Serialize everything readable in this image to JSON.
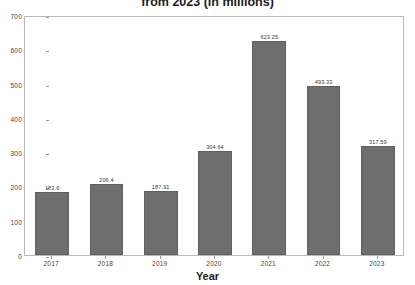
{
  "chart_data": {
    "type": "bar",
    "title": "from 2023 (in millions)",
    "xlabel": "Year",
    "ylabel": "",
    "categories": [
      "2017",
      "2018",
      "2019",
      "2020",
      "2021",
      "2022",
      "2023"
    ],
    "values": [
      183.6,
      206.4,
      187.91,
      304.64,
      623.25,
      493.33,
      317.59
    ],
    "value_labels": [
      "183.6",
      "206.4",
      "187.91",
      "304.64",
      "623.25",
      "493.33",
      "317.59"
    ],
    "ylim": [
      0,
      700
    ],
    "yticks": [
      0,
      100,
      200,
      300,
      400,
      500,
      600,
      700
    ],
    "ytick_labels": [
      "0",
      "100",
      "200",
      "300",
      "400",
      "500",
      "600",
      "700"
    ],
    "grid": false,
    "legend": null,
    "bar_color": "#6e6e6e",
    "bar_edge_color": "#5f5f5f",
    "background_color": "#ffffff",
    "axis_color": "#b9b9b9",
    "text_color": "#1c1c1c"
  }
}
